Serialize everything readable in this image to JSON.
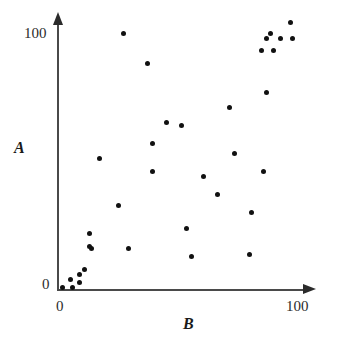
{
  "chart_data": {
    "type": "scatter",
    "title": "",
    "xlabel": "B",
    "ylabel": "A",
    "xlim": [
      0,
      100
    ],
    "ylim": [
      0,
      100
    ],
    "grid": false,
    "legend": null,
    "x_ticks": [
      "0",
      "100"
    ],
    "y_ticks": [
      "0",
      "100"
    ],
    "x_tick_values": [
      0,
      100
    ],
    "y_tick_values": [
      0,
      100
    ],
    "marker": "filled-circle",
    "marker_color": "#111111",
    "axis_color": "#4a4a4a",
    "axis_style": "arrow-ended",
    "n_points": 35,
    "points": [
      {
        "x": 2,
        "y": 1
      },
      {
        "x": 5,
        "y": 4
      },
      {
        "x": 6,
        "y": 1
      },
      {
        "x": 9,
        "y": 6
      },
      {
        "x": 9,
        "y": 3
      },
      {
        "x": 11,
        "y": 8
      },
      {
        "x": 14,
        "y": 16
      },
      {
        "x": 13,
        "y": 22
      },
      {
        "x": 17,
        "y": 51
      },
      {
        "x": 25,
        "y": 33
      },
      {
        "x": 27,
        "y": 100
      },
      {
        "x": 13,
        "y": 17
      },
      {
        "x": 29,
        "y": 16
      },
      {
        "x": 37,
        "y": 88
      },
      {
        "x": 39,
        "y": 57
      },
      {
        "x": 39,
        "y": 46
      },
      {
        "x": 45,
        "y": 65
      },
      {
        "x": 51,
        "y": 64
      },
      {
        "x": 53,
        "y": 24
      },
      {
        "x": 55,
        "y": 13
      },
      {
        "x": 60,
        "y": 44
      },
      {
        "x": 66,
        "y": 37
      },
      {
        "x": 71,
        "y": 71
      },
      {
        "x": 73,
        "y": 53
      },
      {
        "x": 80,
        "y": 30
      },
      {
        "x": 79,
        "y": 14
      },
      {
        "x": 85,
        "y": 46
      },
      {
        "x": 86,
        "y": 77
      },
      {
        "x": 84,
        "y": 93
      },
      {
        "x": 89,
        "y": 93
      },
      {
        "x": 86,
        "y": 98
      },
      {
        "x": 92,
        "y": 98
      },
      {
        "x": 88,
        "y": 100
      },
      {
        "x": 97,
        "y": 98
      },
      {
        "x": 96,
        "y": 104
      }
    ]
  }
}
